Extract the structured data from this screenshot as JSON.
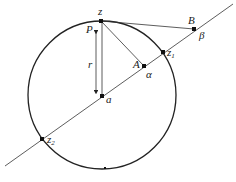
{
  "diagram": {
    "title": "",
    "circle": {
      "cx": 102,
      "cy": 95,
      "r": 74
    },
    "points": {
      "z": {
        "label": "z",
        "x": 101,
        "y": 21
      },
      "P": {
        "label": "P",
        "x": 96,
        "y": 25
      },
      "a": {
        "label": "a",
        "x": 102,
        "y": 96
      },
      "A": {
        "label": "A",
        "x": 144,
        "y": 66
      },
      "alpha": {
        "label": "α"
      },
      "B": {
        "label": "B",
        "x": 194,
        "y": 29
      },
      "beta": {
        "label": "β"
      },
      "z1": {
        "label": "z",
        "sub": "1",
        "x": 163,
        "y": 52
      },
      "z2": {
        "label": "z",
        "sub": "2",
        "x": 42,
        "y": 139
      }
    },
    "r_label": "r",
    "line": {
      "x1": 5,
      "y1": 166,
      "x2": 233,
      "y2": 4
    }
  }
}
